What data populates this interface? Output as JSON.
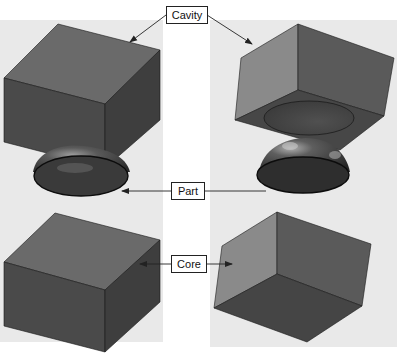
{
  "diagram": {
    "type": "mold-exploded-view",
    "views": [
      {
        "name": "left-view",
        "description": "Cavity block above hemispherical part above core block (viewed from above)"
      },
      {
        "name": "right-view",
        "description": "Cavity block showing hemispherical recess, part, and core block (viewed from below)"
      }
    ],
    "labels": {
      "cavity": "Cavity",
      "part": "Part",
      "core": "Core"
    },
    "colors": {
      "panel_bg": "#e9e9e9",
      "block_top": "#6a6a6a",
      "block_front": "#4a4a4a",
      "block_side": "#3e3e3e",
      "block_light_face": "#8a8a8a",
      "part_dark": "#2e2e2e",
      "outline": "#1a1a1a",
      "leader": "#222222"
    }
  }
}
